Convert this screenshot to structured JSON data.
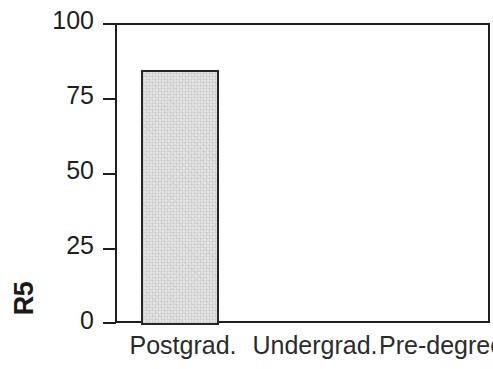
{
  "chart_data": {
    "type": "bar",
    "title": "",
    "xlabel": "",
    "ylabel": "R5",
    "categories": [
      "Postgrad.",
      "Undergrad.",
      "Pre-degree"
    ],
    "values": [
      85,
      0,
      0
    ],
    "ylim": [
      0,
      100
    ],
    "yticks": [
      0,
      25,
      50,
      75,
      100
    ],
    "ytick_labels": [
      "0",
      "25",
      "50",
      "75",
      "100"
    ],
    "grid": false,
    "legend": false,
    "bar_fill_color": "#e6e6e6",
    "bar_edge_color": "#262626",
    "axis_color": "#1f1f1f",
    "background_color": "#ffffff"
  },
  "axis": {
    "y_title": "R5",
    "tick_labels": {
      "t100": "100",
      "t75": "75",
      "t50": "50",
      "t25": "25",
      "t0": "0"
    }
  },
  "xaxis": {
    "labels": {
      "cat0": "Postgrad.",
      "cat1": "Undergrad.",
      "cat2": "Pre-degree"
    }
  }
}
